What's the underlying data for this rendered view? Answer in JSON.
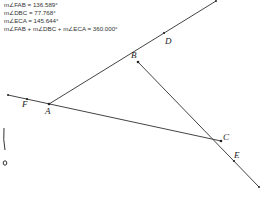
{
  "measurements": [
    {
      "text": "m∠FAB = 136.589°"
    },
    {
      "text": "m∠DBC = 77.768°"
    },
    {
      "text": "m∠ECA = 145.644°"
    },
    {
      "text": "m∠FAB + m∠DBC + m∠ECA = 360.000°"
    }
  ],
  "points": {
    "A": {
      "label": "A"
    },
    "B": {
      "label": "B"
    },
    "C": {
      "label": "C"
    },
    "D": {
      "label": "D"
    },
    "E": {
      "label": "E"
    },
    "F": {
      "label": "F"
    }
  },
  "colors": {
    "line": "#444444",
    "text": "#333333",
    "background": "#ffffff"
  }
}
